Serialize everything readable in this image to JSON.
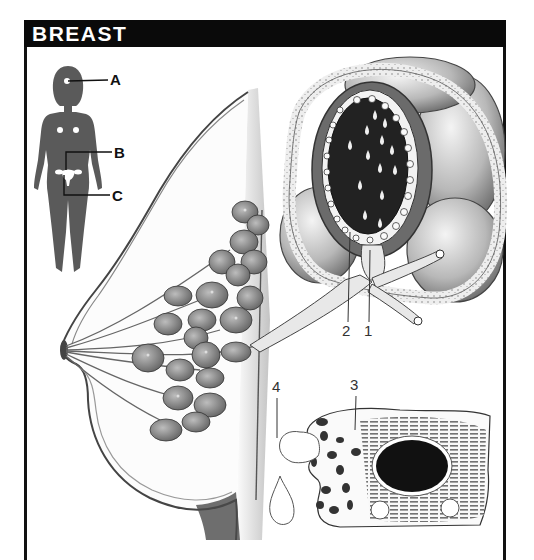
{
  "header": {
    "title": "BREAST"
  },
  "figure": {
    "silhouette": {
      "labels": [
        {
          "id": "A",
          "text": "A"
        },
        {
          "id": "B",
          "text": "B"
        },
        {
          "id": "C",
          "text": "C"
        }
      ]
    },
    "lobule_detail": {
      "labels": [
        {
          "id": "1",
          "text": "1"
        },
        {
          "id": "2",
          "text": "2"
        }
      ]
    },
    "secretory_cell": {
      "labels": [
        {
          "id": "3",
          "text": "3"
        },
        {
          "id": "4",
          "text": "4"
        }
      ]
    },
    "colors": {
      "header_bg": "#0a0a0a",
      "header_text": "#ffffff",
      "silhouette": "#5a5a5a",
      "lumen": "#1a1a1a",
      "nucleus": "#111111"
    }
  }
}
